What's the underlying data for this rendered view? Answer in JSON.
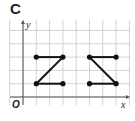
{
  "panel_label": "C",
  "axes": {
    "x_label": "x",
    "y_label": "y",
    "origin_label": "O"
  },
  "grid": {
    "x_min": -1,
    "x_max": 8,
    "y_min": -0.5,
    "y_max": 6,
    "unit": 1
  },
  "figures": [
    {
      "name": "Z-shape",
      "points": [
        [
          1,
          3
        ],
        [
          3,
          3
        ],
        [
          1,
          1
        ],
        [
          3,
          1
        ]
      ],
      "segments": [
        [
          [
            1,
            3
          ],
          [
            3,
            3
          ]
        ],
        [
          [
            3,
            3
          ],
          [
            1,
            1
          ]
        ],
        [
          [
            1,
            1
          ],
          [
            3,
            1
          ]
        ]
      ]
    },
    {
      "name": "reflected-Z-shape",
      "points": [
        [
          5,
          3
        ],
        [
          7,
          3
        ],
        [
          5,
          1
        ],
        [
          7,
          1
        ]
      ],
      "segments": [
        [
          [
            5,
            3
          ],
          [
            7,
            3
          ]
        ],
        [
          [
            5,
            3
          ],
          [
            7,
            1
          ]
        ],
        [
          [
            5,
            1
          ],
          [
            7,
            1
          ]
        ]
      ]
    }
  ],
  "colors": {
    "grid": "#c8c8c8",
    "axis": "#555555",
    "figure": "#111111"
  }
}
